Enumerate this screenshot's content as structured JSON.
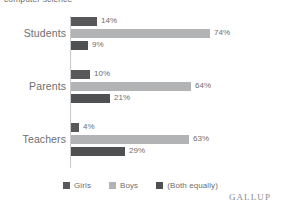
{
  "chart_data": {
    "type": "bar",
    "orientation": "horizontal",
    "title": "computer science",
    "xlabel": "",
    "ylabel": "",
    "xlim": [
      0,
      80
    ],
    "grid": false,
    "legend_position": "bottom",
    "categories": [
      "Students",
      "Parents",
      "Teachers"
    ],
    "series": [
      {
        "name": "Girls",
        "color": "#58585a",
        "values": [
          14,
          10,
          4
        ],
        "labels": [
          "14%",
          "10%",
          "4%"
        ]
      },
      {
        "name": "Boys",
        "color": "#b2b3b5",
        "values": [
          74,
          64,
          63
        ],
        "labels": [
          "74%",
          "64%",
          "63%"
        ]
      },
      {
        "name": "(Both equally)",
        "color": "#4f5052",
        "values": [
          9,
          21,
          29
        ],
        "labels": [
          "9%",
          "21%",
          "29%"
        ]
      }
    ],
    "brand": "GALLUP"
  },
  "colors": {
    "background": "#ffffff",
    "axis": "#c9c9c9",
    "text": "#6d6e70",
    "girls": "#58585a",
    "boys": "#b2b3b5",
    "both": "#4f5052"
  }
}
